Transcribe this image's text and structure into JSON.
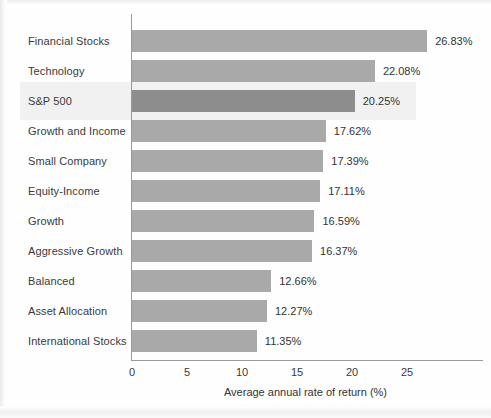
{
  "chart_data": {
    "type": "bar",
    "orientation": "horizontal",
    "title": "",
    "xlabel": "Average annual rate of return (%)",
    "ylabel": "",
    "xlim": [
      0,
      27
    ],
    "xticks": [
      0,
      5,
      10,
      15,
      20,
      25
    ],
    "grid": false,
    "legend": null,
    "categories": [
      "Financial Stocks",
      "Technology",
      "S&P 500",
      "Growth and Income",
      "Small Company",
      "Equity-Income",
      "Growth",
      "Aggressive Growth",
      "Balanced",
      "Asset Allocation",
      "International Stocks"
    ],
    "values": [
      26.83,
      22.08,
      20.25,
      17.62,
      17.39,
      17.11,
      16.59,
      16.37,
      12.66,
      12.27,
      11.35
    ],
    "data_labels": [
      "26.83%",
      "22.08%",
      "20.25%",
      "17.62%",
      "17.39%",
      "17.11%",
      "16.59%",
      "16.37%",
      "12.66%",
      "12.27%",
      "11.35%"
    ],
    "highlighted_category": "S&P 500",
    "highlighted_index": 2,
    "colors": {
      "bar": "#a9a9a9",
      "bar_highlight": "#8d8d8d",
      "highlight_band": "#f1f1f1",
      "axis": "#9a9a9a",
      "text": "#333333",
      "background": "#fefefe"
    }
  }
}
